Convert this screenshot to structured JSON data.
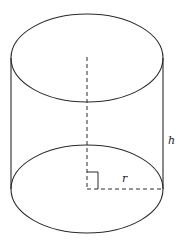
{
  "diagram": {
    "labels": {
      "height": "h",
      "radius": "r"
    },
    "colors": {
      "stroke": "#2a2a2a",
      "background": "#ffffff"
    },
    "geometry": {
      "center_x": 87,
      "top_center_y": 58,
      "bottom_center_y": 189,
      "rx": 76,
      "ry": 44
    }
  }
}
